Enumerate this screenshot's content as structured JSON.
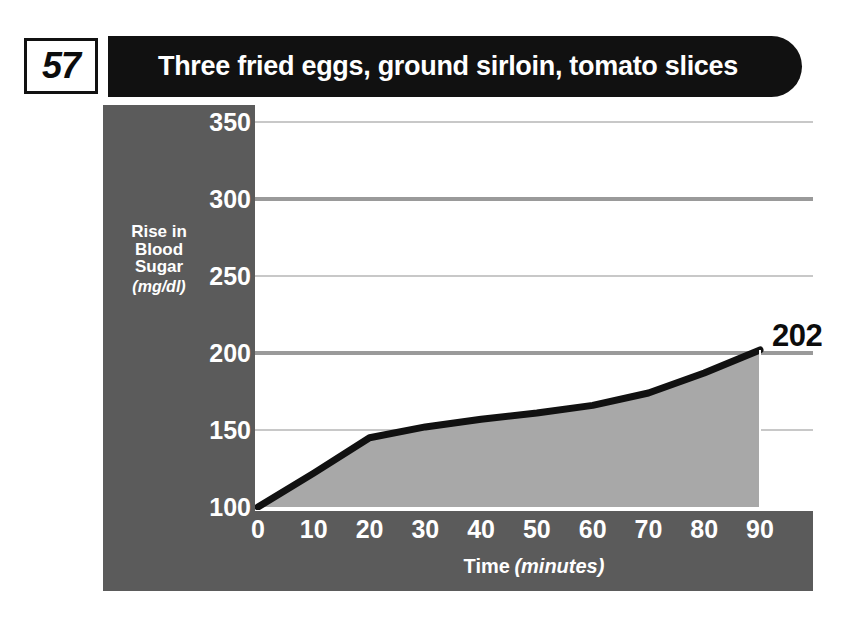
{
  "header": {
    "number": "57",
    "title": "Three fried eggs, ground sirloin, tomato slices"
  },
  "chart_data": {
    "type": "area",
    "title": "Three fried eggs, ground sirloin, tomato slices",
    "xlabel_main": "Time",
    "xlabel_unit": "(minutes)",
    "ylabel_line1": "Rise in",
    "ylabel_line2": "Blood",
    "ylabel_line3": "Sugar",
    "ylabel_unit": "(mg/dl)",
    "x": [
      0,
      10,
      20,
      30,
      40,
      50,
      60,
      70,
      80,
      90
    ],
    "values": [
      100,
      122,
      145,
      152,
      157,
      161,
      166,
      174,
      187,
      202
    ],
    "xticks": [
      "0",
      "10",
      "20",
      "30",
      "40",
      "50",
      "60",
      "70",
      "80",
      "90"
    ],
    "yticks": [
      "100",
      "150",
      "200",
      "250",
      "300",
      "350"
    ],
    "xlim": [
      0,
      90
    ],
    "ylim": [
      100,
      350
    ],
    "grid": true,
    "end_value_label": "202",
    "colors": {
      "panel": "#5b5b5b",
      "header_bar": "#111111",
      "area_fill": "#a8a8a8",
      "line": "#111111",
      "plot_background": "#ffffff",
      "gridline_major": "#9a9a9a",
      "gridline_minor": "#c8c8c8"
    }
  }
}
